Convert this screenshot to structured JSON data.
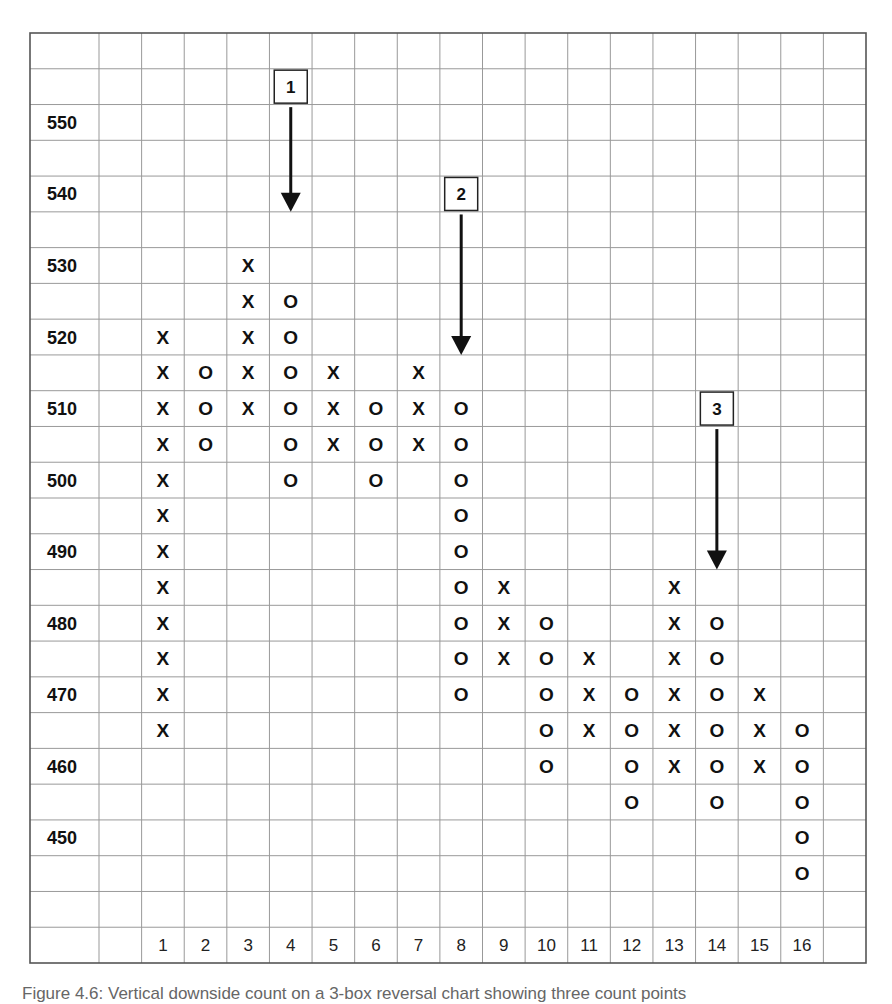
{
  "chart_data": {
    "type": "point-and-figure",
    "title": "",
    "box_size": 5,
    "reversal": 3,
    "xlabel": "",
    "ylabel": "",
    "y_tick_labels": [
      550,
      540,
      530,
      520,
      510,
      500,
      490,
      480,
      470,
      460,
      450
    ],
    "ylim": [
      440,
      560
    ],
    "x_tick_labels": [
      "1",
      "2",
      "3",
      "4",
      "5",
      "6",
      "7",
      "8",
      "9",
      "10",
      "11",
      "12",
      "13",
      "14",
      "15",
      "16"
    ],
    "grid": true,
    "columns": [
      {
        "col": 1,
        "symbol": "X",
        "high": 520,
        "low": 465
      },
      {
        "col": 2,
        "symbol": "O",
        "high": 515,
        "low": 505
      },
      {
        "col": 3,
        "symbol": "X",
        "high": 530,
        "low": 510
      },
      {
        "col": 4,
        "symbol": "O",
        "high": 525,
        "low": 500
      },
      {
        "col": 5,
        "symbol": "X",
        "high": 515,
        "low": 505
      },
      {
        "col": 6,
        "symbol": "O",
        "high": 510,
        "low": 500
      },
      {
        "col": 7,
        "symbol": "X",
        "high": 515,
        "low": 505
      },
      {
        "col": 8,
        "symbol": "O",
        "high": 510,
        "low": 470
      },
      {
        "col": 9,
        "symbol": "X",
        "high": 485,
        "low": 475
      },
      {
        "col": 10,
        "symbol": "O",
        "high": 480,
        "low": 460
      },
      {
        "col": 11,
        "symbol": "X",
        "high": 475,
        "low": 465
      },
      {
        "col": 12,
        "symbol": "O",
        "high": 470,
        "low": 455
      },
      {
        "col": 13,
        "symbol": "X",
        "high": 485,
        "low": 460
      },
      {
        "col": 14,
        "symbol": "O",
        "high": 480,
        "low": 455
      },
      {
        "col": 15,
        "symbol": "X",
        "high": 470,
        "low": 460
      },
      {
        "col": 16,
        "symbol": "O",
        "high": 465,
        "low": 445
      }
    ],
    "annotations": [
      {
        "label": "1",
        "col": 4,
        "box_price": 555,
        "arrow_tip_price": 537.5,
        "type": "down-arrow"
      },
      {
        "label": "2",
        "col": 8,
        "box_price": 540,
        "arrow_tip_price": 517.5,
        "type": "down-arrow"
      },
      {
        "label": "3",
        "col": 14,
        "box_price": 510,
        "arrow_tip_price": 487.5,
        "type": "down-arrow"
      }
    ]
  },
  "caption": "Figure 4.6: Vertical downside count on a 3-box reversal chart showing three count points"
}
